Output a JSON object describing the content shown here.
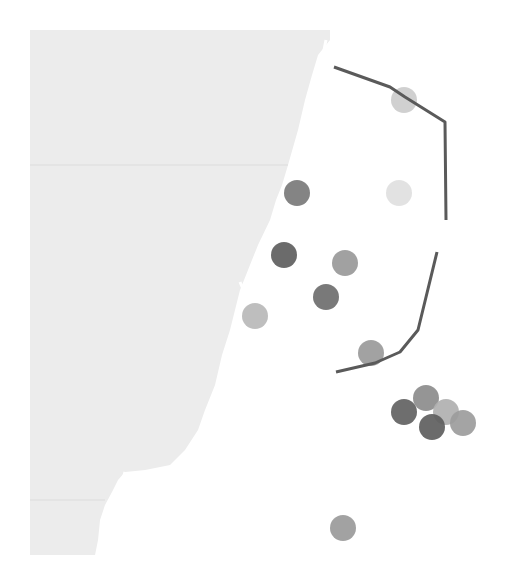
{
  "map": {
    "width": 518,
    "height": 561,
    "background": "#ffffff",
    "land_color": "#ececec",
    "border_color": "#dcdcdc",
    "line_color": "#5a5a5a",
    "land_polygon": "30,30 330,30 330,40 318,55 312,75 305,100 298,130 288,165 282,185 276,200 270,220 258,245 248,270 240,290 235,310 230,330 222,355 215,385 205,410 198,430 185,450 170,465 145,470 125,472 118,480 112,492 105,505 100,520 98,540 95,555 30,555",
    "inlet_paths": [
      "M 326 40 L 322 60 L 334 68",
      "M 240 282 L 246 296",
      "M 125 472 L 112 520"
    ],
    "state_borders": [
      {
        "y": 165,
        "x1": 30,
        "x2": 288
      },
      {
        "y": 500,
        "x1": 30,
        "x2": 105
      }
    ],
    "lines": [
      {
        "name": "north-boundary-line",
        "points": "334,67 390,87 405,97 445,122 446,220"
      },
      {
        "name": "south-boundary-line",
        "points": "437,252 418,330 400,352 375,363 336,372"
      }
    ],
    "markers": [
      {
        "name": "marker-1",
        "cx": 404,
        "cy": 100,
        "r": 13,
        "color": "#cccccc"
      },
      {
        "name": "marker-2",
        "cx": 399,
        "cy": 193,
        "r": 13,
        "color": "#e0e0e0"
      },
      {
        "name": "marker-3",
        "cx": 297,
        "cy": 193,
        "r": 13,
        "color": "#7a7a7a"
      },
      {
        "name": "marker-4",
        "cx": 284,
        "cy": 255,
        "r": 13,
        "color": "#5e5e5e"
      },
      {
        "name": "marker-5",
        "cx": 345,
        "cy": 263,
        "r": 13,
        "color": "#999999"
      },
      {
        "name": "marker-6",
        "cx": 326,
        "cy": 297,
        "r": 13,
        "color": "#6e6e6e"
      },
      {
        "name": "marker-7",
        "cx": 255,
        "cy": 316,
        "r": 13,
        "color": "#b8b8b8"
      },
      {
        "name": "marker-8",
        "cx": 371,
        "cy": 353,
        "r": 13,
        "color": "#9a9a9a"
      },
      {
        "name": "marker-9",
        "cx": 426,
        "cy": 398,
        "r": 13,
        "color": "#8c8c8c"
      },
      {
        "name": "marker-10",
        "cx": 446,
        "cy": 412,
        "r": 13,
        "color": "#b0b0b0"
      },
      {
        "name": "marker-11",
        "cx": 404,
        "cy": 412,
        "r": 13,
        "color": "#626262"
      },
      {
        "name": "marker-12",
        "cx": 463,
        "cy": 423,
        "r": 13,
        "color": "#9c9c9c"
      },
      {
        "name": "marker-13",
        "cx": 432,
        "cy": 427,
        "r": 13,
        "color": "#5e5e5e"
      },
      {
        "name": "marker-14",
        "cx": 343,
        "cy": 528,
        "r": 13,
        "color": "#9a9a9a"
      }
    ]
  }
}
